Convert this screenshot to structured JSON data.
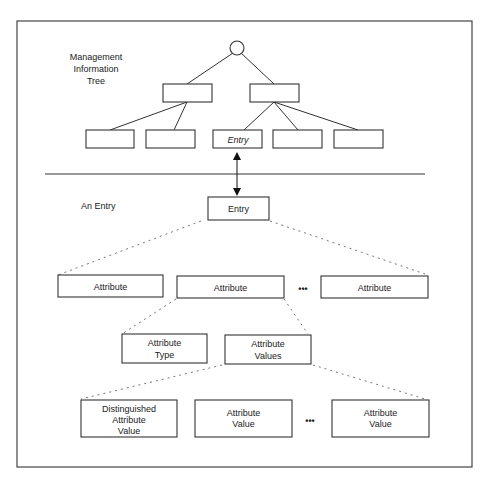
{
  "tree": {
    "label_lines": [
      "Management",
      "Information",
      "Tree"
    ],
    "entry_node_label": "Entry"
  },
  "entry_section": {
    "label": "An Entry",
    "entry_box_label": "Entry"
  },
  "attributes": {
    "items": [
      "Attribute",
      "Attribute",
      "Attribute"
    ],
    "ellipsis": "•••"
  },
  "attribute_parts": {
    "type_lines": [
      "Attribute",
      "Type"
    ],
    "values_lines": [
      "Attribute",
      "Values"
    ]
  },
  "values": {
    "items": [
      [
        "Distinguished",
        "Attribute",
        "Value"
      ],
      [
        "Attribute",
        "Value"
      ],
      [
        "Attribute",
        "Value"
      ]
    ],
    "ellipsis": "•••"
  }
}
